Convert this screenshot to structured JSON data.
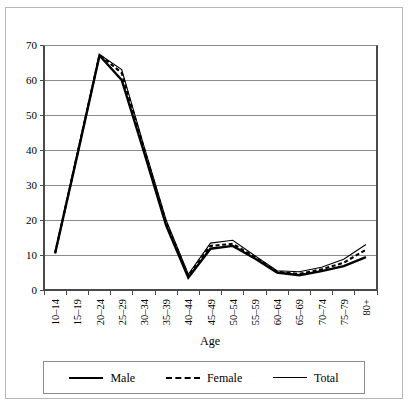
{
  "chart_data": {
    "type": "line",
    "title": "",
    "xlabel": "Age",
    "ylabel": "",
    "ylim": [
      0,
      70
    ],
    "yticks": [
      0,
      10,
      20,
      30,
      40,
      50,
      60,
      70
    ],
    "grid": true,
    "legend_position": "bottom",
    "categories": [
      "10–14",
      "15–19",
      "20–24",
      "25–29",
      "30–34",
      "35–39",
      "40–44",
      "45–49",
      "50–54",
      "55–59",
      "60–64",
      "65–69",
      "70–74",
      "75–79",
      "80+"
    ],
    "series": [
      {
        "name": "Male",
        "style": "solid-thick",
        "values": [
          10.5,
          38.5,
          67.0,
          60.0,
          39.5,
          18.5,
          3.5,
          11.8,
          12.6,
          9.0,
          5.0,
          4.2,
          5.4,
          6.8,
          9.4
        ]
      },
      {
        "name": "Female",
        "style": "dashed",
        "values": [
          10.5,
          38.8,
          67.2,
          62.0,
          40.5,
          19.3,
          4.0,
          12.6,
          13.2,
          9.4,
          5.2,
          4.6,
          5.9,
          7.8,
          11.5
        ]
      },
      {
        "name": "Total",
        "style": "solid-thin",
        "values": [
          10.5,
          39.2,
          67.3,
          63.0,
          41.2,
          20.0,
          4.5,
          13.4,
          14.2,
          9.8,
          5.5,
          5.2,
          6.5,
          8.8,
          13.0
        ]
      }
    ]
  },
  "legend": {
    "items": [
      {
        "label": "Male",
        "style": "male"
      },
      {
        "label": "Female",
        "style": "female"
      },
      {
        "label": "Total",
        "style": "total"
      }
    ]
  },
  "colors": {
    "series": "#000000",
    "gridline": "#8a8a8a",
    "axis": "#4a4a4a",
    "frame": "#b8b8b8",
    "background": "#ffffff"
  }
}
